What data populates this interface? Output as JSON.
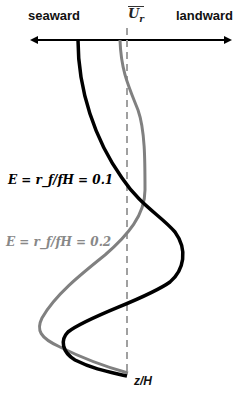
{
  "labels": {
    "seaward": "seaward",
    "landward": "landward",
    "mean_velocity": "U",
    "mean_velocity_sub": "r",
    "curve1": "E = r_f/fH = 0.1",
    "curve2": "E = r_f/fH = 0.2",
    "vertical_axis": "z/H"
  },
  "colors": {
    "curve1": "#000000",
    "curve2": "#808080",
    "axis": "#000000",
    "dashed_line": "#a0a0a0"
  }
}
